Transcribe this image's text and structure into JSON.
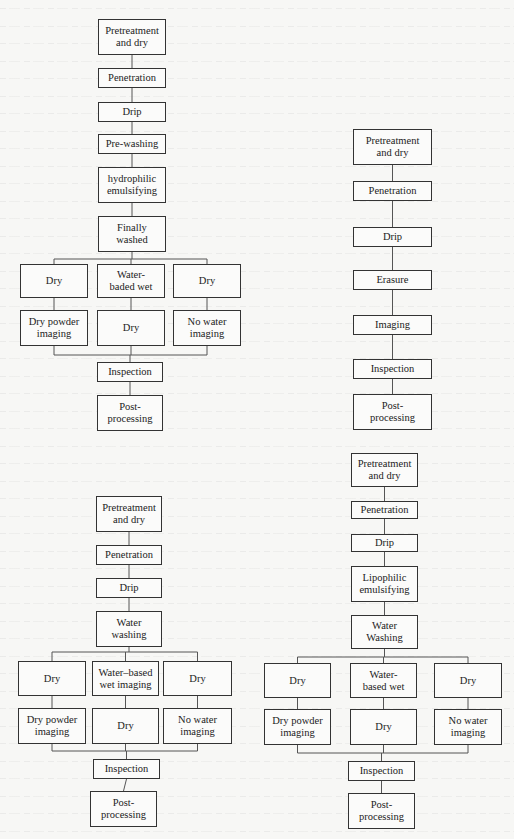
{
  "diagram": {
    "type": "process-flowcharts",
    "flowcharts": [
      {
        "id": "flow-a",
        "name": "hydrophilic-post-emulsified process",
        "steps": [
          "Pretreatment\nand dry",
          "Penetration",
          "Drip",
          "Pre-washing",
          "hydrophilic\nemulsifying",
          "Finally\nwashed"
        ],
        "branches": [
          [
            "Dry",
            "Dry powder\nimaging"
          ],
          [
            "Water-\nbaded wet",
            "Dry"
          ],
          [
            "Dry",
            "No water\nimaging"
          ]
        ],
        "tail": [
          "Inspection",
          "Post-\nprocessing"
        ]
      },
      {
        "id": "flow-b",
        "name": "solvent-removable process",
        "steps": [
          "Pretreatment\nand dry",
          "Penetration",
          "Drip",
          "Erasure",
          "Imaging",
          "Inspection",
          "Post-\nprocessing"
        ],
        "branches": [],
        "tail": []
      },
      {
        "id": "flow-c",
        "name": "water-washable process",
        "steps": [
          "Pretreatment\nand dry",
          "Penetration",
          "Drip",
          "Water\nwashing"
        ],
        "branches": [
          [
            "Dry",
            "Dry powder\nimaging"
          ],
          [
            "Water–based\nwet imaging",
            "Dry"
          ],
          [
            "Dry",
            "No water\nimaging"
          ]
        ],
        "tail": [
          "Inspection",
          "Post-\nprocessing"
        ]
      },
      {
        "id": "flow-d",
        "name": "lipophilic-post-emulsified process",
        "steps": [
          "Pretreatment\nand dry",
          "Penetration",
          "Drip",
          "Lipophilic\nemulsifying",
          "Water\nWashing"
        ],
        "branches": [
          [
            "Dry",
            "Dry powder\nimaging"
          ],
          [
            "Water-\nbased wet",
            "Dry"
          ],
          [
            "Dry",
            "No water\nimaging"
          ]
        ],
        "tail": [
          "Inspection",
          "Post-\nprocessing"
        ]
      }
    ]
  }
}
